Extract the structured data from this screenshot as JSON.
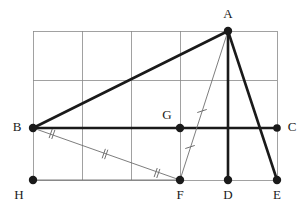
{
  "figure": {
    "type": "euclidean-geometry-diagram",
    "canvas": {
      "width": 305,
      "height": 208
    },
    "colors": {
      "grid": "#8a8a8a",
      "heavy_stroke": "#1a1a1a",
      "thin_stroke": "#6e6e6e",
      "vertex_fill": "#1a1a1a",
      "label_fill": "#1a1a1a",
      "background": "#ffffff"
    },
    "stroke_widths": {
      "grid": 0.8,
      "heavy": 2.6,
      "thin": 0.9,
      "tick": 0.9
    }
  },
  "grid": {
    "visible": true,
    "x_lines": [
      33,
      82,
      131,
      180,
      228,
      277
    ],
    "y_lines": [
      31,
      80,
      128,
      180
    ],
    "left": 33,
    "right": 277,
    "top": 31,
    "bottom": 180
  },
  "points": [
    {
      "id": "A",
      "label": "A",
      "x": 228,
      "y": 31,
      "label_x": 228,
      "label_y": 15,
      "dot": true,
      "radius": 4.2
    },
    {
      "id": "B",
      "label": "B",
      "x": 33,
      "y": 128,
      "label_x": 17,
      "label_y": 128,
      "dot": true,
      "radius": 4.2
    },
    {
      "id": "C",
      "label": "C",
      "x": 277,
      "y": 128,
      "label_x": 292,
      "label_y": 128,
      "dot": true,
      "radius": 3.8
    },
    {
      "id": "D",
      "label": "D",
      "x": 228,
      "y": 180,
      "label_x": 228,
      "label_y": 196,
      "dot": true,
      "radius": 4.2
    },
    {
      "id": "E",
      "label": "E",
      "x": 277,
      "y": 180,
      "label_x": 277,
      "label_y": 196,
      "dot": true,
      "radius": 4.2
    },
    {
      "id": "F",
      "label": "F",
      "x": 180,
      "y": 180,
      "label_x": 180,
      "label_y": 196,
      "dot": true,
      "radius": 4.2
    },
    {
      "id": "G",
      "label": "G",
      "x": 180,
      "y": 128,
      "label_x": 167,
      "label_y": 116,
      "dot": true,
      "radius": 4.2
    },
    {
      "id": "H",
      "label": "H",
      "x": 33,
      "y": 180,
      "label_x": 19,
      "label_y": 196,
      "dot": true,
      "radius": 4.2
    }
  ],
  "segments": [
    {
      "id": "BA",
      "from": "B",
      "to": "A",
      "weight": "heavy",
      "x1": 33,
      "y1": 128,
      "x2": 228,
      "y2": 31
    },
    {
      "id": "BC",
      "from": "B",
      "to": "C",
      "weight": "heavy",
      "x1": 33,
      "y1": 128,
      "x2": 277,
      "y2": 128
    },
    {
      "id": "AD",
      "from": "A",
      "to": "D",
      "weight": "heavy",
      "x1": 228,
      "y1": 31,
      "x2": 228,
      "y2": 180
    },
    {
      "id": "AE",
      "from": "A",
      "to": "E",
      "weight": "heavy",
      "x1": 228,
      "y1": 31,
      "x2": 277,
      "y2": 180
    },
    {
      "id": "AF",
      "from": "A",
      "to": "F",
      "weight": "thin",
      "x1": 228,
      "y1": 31,
      "x2": 180,
      "y2": 180
    },
    {
      "id": "BF",
      "from": "B",
      "to": "F",
      "weight": "thin",
      "x1": 33,
      "y1": 128,
      "x2": 180,
      "y2": 180
    },
    {
      "id": "HF",
      "from": "H",
      "to": "F",
      "weight": "thin",
      "x1": 33,
      "y1": 180,
      "x2": 180,
      "y2": 180
    }
  ],
  "congruence_ticks": [
    {
      "id": "tick-AG-on-AF",
      "on_segment": "AF",
      "count": 1,
      "x": 202,
      "y": 111,
      "angle_deg": 72
    },
    {
      "id": "tick-GF-on-AF",
      "on_segment": "AF",
      "count": 1,
      "x": 190,
      "y": 147,
      "angle_deg": 72
    },
    {
      "id": "tick-BF-middle",
      "on_segment": "BF",
      "count": 2,
      "x": 105,
      "y": 154,
      "angle_deg": 19
    }
  ],
  "angle_marks": [
    {
      "id": "angle-at-B-FBC",
      "vertex": "B",
      "count": 2,
      "x": 52,
      "y": 134,
      "angle_deg": 19
    },
    {
      "id": "angle-at-F-BFH",
      "vertex": "F",
      "count": 2,
      "x": 157,
      "y": 173,
      "angle_deg": 19
    },
    {
      "id": "angle-at-A-FAD",
      "vertex": "A",
      "count": 1,
      "arc_radius": 41,
      "start_deg": 252,
      "end_deg": 270
    },
    {
      "id": "angle-at-A-DAE",
      "vertex": "A",
      "count": 1,
      "arc_radius": 36,
      "start_deg": 252,
      "end_deg": 288
    }
  ],
  "labels_visible": [
    "A",
    "B",
    "C",
    "D",
    "E",
    "F",
    "G",
    "H"
  ]
}
